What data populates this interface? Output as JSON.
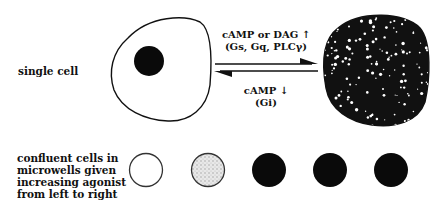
{
  "labels": {
    "single_cell": "single cell",
    "confluent": [
      "confluent cells in",
      "microwells given",
      "increasing agonist",
      "from left to right"
    ]
  },
  "forward_arrow": {
    "line1": "cAMP or DAG ↑",
    "line2": "(Gs, Gq, PLCγ)"
  },
  "reverse_arrow": {
    "line1": "cAMP ↓",
    "line2": "(Gi)"
  },
  "microwells": [
    {
      "state": "empty"
    },
    {
      "state": "stippled"
    },
    {
      "state": "filled"
    },
    {
      "state": "filled"
    },
    {
      "state": "filled"
    }
  ],
  "colors": {
    "ink": "#111111",
    "background": "#ffffff",
    "stipple": "#cfcfcf"
  }
}
